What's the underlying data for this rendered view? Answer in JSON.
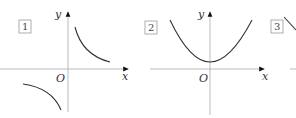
{
  "panels": [
    {
      "id": "1",
      "label": "1",
      "curve": "hyperbola (two branches, quadrants I and III)",
      "axis_x": "x",
      "axis_y": "y",
      "origin": "O"
    },
    {
      "id": "2",
      "label": "2",
      "curve": "upward parabola with positive vertex",
      "axis_x": "x",
      "axis_y": "y",
      "origin": "O"
    },
    {
      "id": "3",
      "label": "3",
      "curve": "partially visible (cut off)",
      "axis_x": "",
      "axis_y": "",
      "origin": ""
    }
  ],
  "colors": {
    "axis": "#999999",
    "curve": "#333333",
    "box": "#999999"
  }
}
